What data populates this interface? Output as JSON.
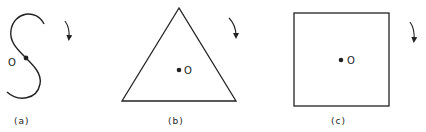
{
  "figures": [
    {
      "id": "a",
      "shape": "S-curve",
      "caption": "(a)",
      "center_label": "O",
      "rotation_arrow": "clockwise-arrow"
    },
    {
      "id": "b",
      "shape": "equilateral-triangle",
      "caption": "(b)",
      "center_label": "O",
      "rotation_arrow": "clockwise-arrow"
    },
    {
      "id": "c",
      "shape": "square",
      "caption": "(c)",
      "center_label": "O",
      "rotation_arrow": "clockwise-arrow"
    }
  ],
  "colors": {
    "stroke": "#222222",
    "background": "#ffffff"
  }
}
